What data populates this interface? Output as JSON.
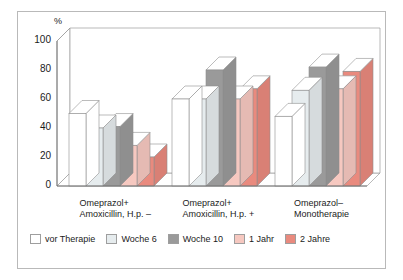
{
  "chart_data": {
    "type": "bar",
    "title": "",
    "subtitle": "",
    "xlabel": "",
    "ylabel": "%",
    "ylim": [
      0,
      100
    ],
    "yticks": [
      0,
      20,
      40,
      60,
      80,
      100
    ],
    "grid": false,
    "legend_position": "bottom",
    "style": "3d-grouped-columns",
    "categories": [
      "Omeprazol+\nAmoxicillin, H.p. –",
      "Omeprazol+\nAmoxicillin, H.p. +",
      "Omeprazol–\nMonotherapie"
    ],
    "category_lines": [
      [
        "Omeprazol+",
        "Amoxicillin, H.p. –"
      ],
      [
        "Omeprazol+",
        "Amoxicillin, H.p. +"
      ],
      [
        "Omeprazol–",
        "Monotherapie"
      ]
    ],
    "series": [
      {
        "name": "vor Therapie",
        "color": "#ffffff",
        "values": [
          50,
          60,
          48
        ]
      },
      {
        "name": "Woche 6",
        "color": "#e6ecee",
        "values": [
          40,
          60,
          66
        ]
      },
      {
        "name": "Woche 10",
        "color": "#9a9a9a",
        "values": [
          41,
          80,
          82
        ]
      },
      {
        "name": "1 Jahr",
        "color": "#f6c8c0",
        "values": [
          28,
          60,
          67
        ]
      },
      {
        "name": "2 Jahre",
        "color": "#e98a7e",
        "values": [
          20,
          67,
          79
        ]
      }
    ]
  },
  "axis": {
    "unit_label": "%",
    "tick_labels": [
      "100",
      "80",
      "60",
      "40",
      "20",
      "0"
    ]
  },
  "legend": {
    "items": [
      {
        "label": "vor Therapie",
        "color": "#ffffff"
      },
      {
        "label": "Woche 6",
        "color": "#e6ecee"
      },
      {
        "label": "Woche 10",
        "color": "#9a9a9a"
      },
      {
        "label": "1 Jahr",
        "color": "#f6c8c0"
      },
      {
        "label": "2 Jahre",
        "color": "#e98a7e"
      }
    ]
  }
}
